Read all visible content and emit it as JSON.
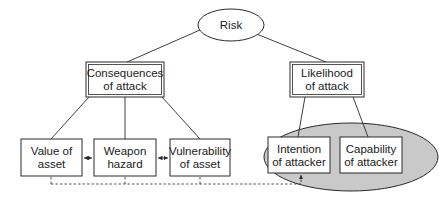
{
  "diagram": {
    "type": "tree",
    "colors": {
      "line": "#2a2a2a",
      "text": "#1a1a1a",
      "highlight_fill": "#c8c8c8",
      "box_fill": "#ffffff"
    },
    "root": {
      "label": "Risk",
      "shape": "ellipse"
    },
    "level1": [
      {
        "id": "consequences",
        "line1": "Consequences",
        "line2": "of attack",
        "shape": "double-rectangle"
      },
      {
        "id": "likelihood",
        "line1": "Likelihood",
        "line2": "of attack",
        "shape": "double-rectangle"
      }
    ],
    "level2": [
      {
        "id": "value",
        "parent": "consequences",
        "line1": "Value of",
        "line2": "asset"
      },
      {
        "id": "weapon",
        "parent": "consequences",
        "line1": "Weapon",
        "line2": "hazard"
      },
      {
        "id": "vulnerability",
        "parent": "consequences",
        "line1": "Vulnerability",
        "line2": "of asset"
      },
      {
        "id": "intention",
        "parent": "likelihood",
        "line1": "Intention",
        "line2": "of attacker",
        "highlighted": true
      },
      {
        "id": "capability",
        "parent": "likelihood",
        "line1": "Capability",
        "line2": "of attacker",
        "highlighted": true
      }
    ],
    "connections": [
      {
        "from": "value",
        "to": "weapon",
        "style": "bidirectional-arrow"
      },
      {
        "from": "weapon",
        "to": "vulnerability",
        "style": "bidirectional-arrow"
      },
      {
        "from": [
          "value",
          "weapon",
          "vulnerability"
        ],
        "to": "intention",
        "style": "dashed-arrow"
      }
    ]
  }
}
